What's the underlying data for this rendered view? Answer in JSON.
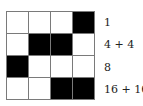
{
  "grid": {
    "rows": 4,
    "cols": 4,
    "cells": [
      [
        0,
        0,
        0,
        1
      ],
      [
        0,
        1,
        1,
        0
      ],
      [
        1,
        0,
        0,
        0
      ],
      [
        0,
        0,
        1,
        1
      ]
    ],
    "colors": {
      "filled": "#000000",
      "empty": "#ffffff",
      "border": "#7a7a7a"
    }
  },
  "labels": [
    "1",
    "4 + 4",
    "8",
    "16 + 16"
  ]
}
